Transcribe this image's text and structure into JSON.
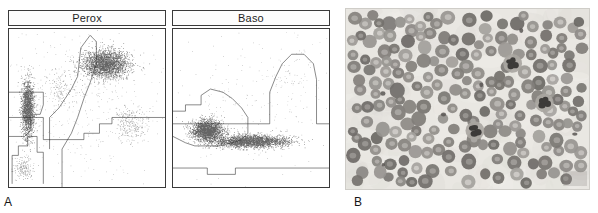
{
  "figure": {
    "panels": [
      {
        "id": "A",
        "letter": "A",
        "kind": "flow-cytometry-cytograms"
      },
      {
        "id": "B",
        "letter": "B",
        "kind": "peripheral-blood-smear-micrograph"
      }
    ]
  },
  "cytograms": [
    {
      "id": "perox",
      "title": "Perox",
      "x": 8,
      "y": 10,
      "w": 158,
      "h": 178,
      "axes": {
        "xlabel": "",
        "ylabel": "",
        "ticks": false,
        "grid": false
      },
      "chart_data": {
        "type": "scatter",
        "title": "Perox",
        "xlabel": "",
        "ylabel": "",
        "xlim": [
          0,
          100
        ],
        "ylim": [
          0,
          100
        ],
        "grid": false,
        "legend": "none",
        "clusters": [
          {
            "name": "lymphocytes",
            "cx": 12,
            "cy": 50,
            "rx": 5,
            "ry": 22,
            "n": 1700,
            "density": "high"
          },
          {
            "name": "neutrophils",
            "cx": 62,
            "cy": 78,
            "rx": 18,
            "ry": 11,
            "n": 2600,
            "density": "high"
          },
          {
            "name": "eosinophils",
            "cx": 78,
            "cy": 40,
            "rx": 10,
            "ry": 10,
            "n": 260,
            "density": "low"
          },
          {
            "name": "monocytes",
            "cx": 34,
            "cy": 62,
            "rx": 11,
            "ry": 12,
            "n": 150,
            "density": "low"
          },
          {
            "name": "noise-debris",
            "cx": 9,
            "cy": 12,
            "rx": 6,
            "ry": 7,
            "n": 170,
            "density": "low"
          },
          {
            "name": "background",
            "cx": 50,
            "cy": 55,
            "rx": 46,
            "ry": 42,
            "n": 420,
            "density": "sparse"
          }
        ],
        "gates": [
          {
            "name": "noise-gate",
            "points": "2,2 2,20 6,20 6,26 12,26 12,32 18,32 18,22 22,22 22,2"
          },
          {
            "name": "lymph-gate",
            "points": "0,32 10,32 14,36 14,46 20,46 22,52 22,60 18,60 10,60 0,60"
          },
          {
            "name": "mono-gate",
            "points": "26,24 26,44 32,50 36,56 40,62 44,70 46,88 52,96 56,92 56,78 52,66 48,56 44,44 40,34 34,24"
          },
          {
            "name": "neut-eos-divider",
            "points": "0,44 22,44 22,30 48,30 48,34 58,34 58,40 66,40 66,44 100,44"
          },
          {
            "name": "vertical-split",
            "points": "34,0 34,24"
          }
        ]
      }
    },
    {
      "id": "baso",
      "title": "Baso",
      "x": 172,
      "y": 10,
      "w": 158,
      "h": 178,
      "axes": {
        "xlabel": "",
        "ylabel": "",
        "ticks": false,
        "grid": false
      },
      "chart_data": {
        "type": "scatter",
        "title": "Baso",
        "xlabel": "",
        "ylabel": "",
        "xlim": [
          0,
          100
        ],
        "ylim": [
          0,
          100
        ],
        "grid": false,
        "legend": "none",
        "clusters": [
          {
            "name": "mononuclear-blast-region",
            "cx": 22,
            "cy": 36,
            "rx": 12,
            "ry": 8,
            "n": 2100,
            "density": "high"
          },
          {
            "name": "pmn-band",
            "cx": 50,
            "cy": 29,
            "rx": 30,
            "ry": 5,
            "n": 2600,
            "density": "high"
          },
          {
            "name": "basophil-region",
            "cx": 76,
            "cy": 72,
            "rx": 12,
            "ry": 14,
            "n": 60,
            "density": "sparse"
          },
          {
            "name": "background",
            "cx": 50,
            "cy": 55,
            "rx": 46,
            "ry": 40,
            "n": 230,
            "density": "sparse"
          }
        ],
        "gates": [
          {
            "name": "mono-gate",
            "points": "0,48 8,48 8,52 18,52 18,58 24,62 32,60 38,56 44,50 48,44 48,34 44,30 38,28 30,26 22,26 14,26 8,28 4,30 0,32"
          },
          {
            "name": "baso-gate",
            "points": "62,40 62,60 66,70 70,78 76,84 84,84 90,78 92,68 92,40"
          },
          {
            "name": "horizontal-split",
            "points": "0,40 62,40"
          },
          {
            "name": "lower-split",
            "points": "0,12 22,12 22,8 40,8 40,12 100,12"
          },
          {
            "name": "right-edge-step",
            "points": "92,40 100,40"
          }
        ]
      }
    }
  ],
  "micrograph": {
    "id": "smear",
    "x": 345,
    "y": 8,
    "w": 245,
    "h": 182,
    "description": "peripheral blood smear",
    "colors": {
      "background": "#e9e7e2",
      "rbc_fill": "#9d9a96",
      "rbc_center": "#cfccc7",
      "wbc_nucleus": "#3d3b39",
      "wbc_cytoplasm": "#a9a6a1"
    },
    "cell_counts": {
      "red_blood_cells": 210,
      "neutrophils": 3,
      "platelets": 6
    }
  }
}
